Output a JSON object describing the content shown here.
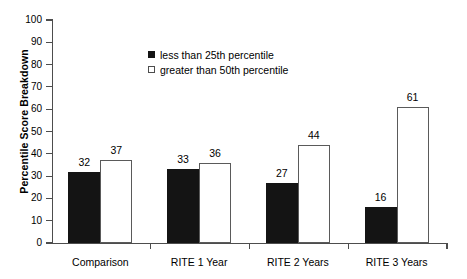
{
  "chart_data": {
    "type": "bar",
    "title": "",
    "subtitle": "",
    "xlabel": "",
    "ylabel": "Percentile Score Breakdown",
    "ylim": [
      0,
      100
    ],
    "ytick_step": 10,
    "yticks": [
      0,
      10,
      20,
      30,
      40,
      50,
      60,
      70,
      80,
      90,
      100
    ],
    "ytick_labels": [
      "0",
      "10",
      "20",
      "30",
      "40",
      "50",
      "60",
      "70",
      "80",
      "90",
      "100"
    ],
    "grid": false,
    "legend_position": "upper-center-left",
    "categories": [
      "Comparison",
      "RITE 1 Year",
      "RITE 2 Years",
      "RITE 3 Years"
    ],
    "series": [
      {
        "name": "less than 25th percentile",
        "color": "#141414",
        "fill": "solid",
        "values": [
          32,
          33,
          27,
          16
        ],
        "value_labels": [
          "32",
          "33",
          "27",
          "16"
        ]
      },
      {
        "name": "greater than 50th percentile",
        "color": "#ffffff",
        "edge_color": "#5a5a5a",
        "fill": "open",
        "values": [
          37,
          36,
          44,
          61
        ],
        "value_labels": [
          "37",
          "36",
          "44",
          "61"
        ]
      }
    ]
  },
  "legend": {
    "items": [
      {
        "label": "less than 25th percentile",
        "swatch": "filled-black-square"
      },
      {
        "label": "greater than 50th percentile",
        "swatch": "open-white-square"
      }
    ]
  },
  "axes": {
    "y_title": "Percentile Score Breakdown"
  },
  "colors": {
    "bar_dark": "#141414",
    "bar_light": "#ffffff",
    "bar_light_edge": "#5a5a5a",
    "axis": "#4d4d4d",
    "text": "#000000",
    "background": "#ffffff"
  }
}
